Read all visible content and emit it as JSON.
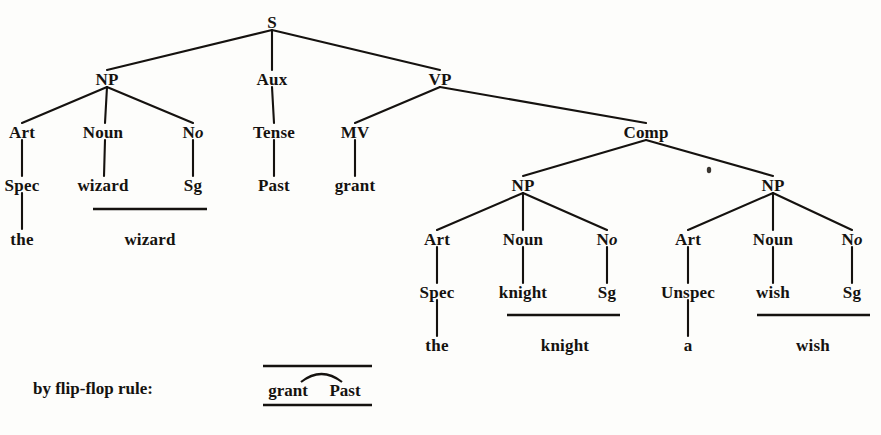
{
  "figure": {
    "type": "syntax-tree-diagram",
    "ink_color": "#15120f",
    "background_color": "#fdfdfb"
  },
  "tree": {
    "root": {
      "label": "S",
      "x": 272,
      "y": 22
    },
    "level1": [
      {
        "label": "NP",
        "x": 107,
        "y": 79
      },
      {
        "label": "Aux",
        "x": 272,
        "y": 79
      },
      {
        "label": "VP",
        "x": 440,
        "y": 79
      }
    ],
    "level2": [
      {
        "label": "Art",
        "x": 22,
        "y": 132
      },
      {
        "label": "Noun",
        "x": 103,
        "y": 132
      },
      {
        "label": "No",
        "x": 193,
        "y": 132,
        "italic_tail": "o",
        "roman_head": "N"
      },
      {
        "label": "Tense",
        "x": 274,
        "y": 132
      },
      {
        "label": "MV",
        "x": 355,
        "y": 132
      },
      {
        "label": "Comp",
        "x": 646,
        "y": 132
      }
    ],
    "level3": [
      {
        "label": "Spec",
        "x": 22,
        "y": 185
      },
      {
        "label": "wizard",
        "x": 103,
        "y": 185
      },
      {
        "label": "Sg",
        "x": 193,
        "y": 185
      },
      {
        "label": "Past",
        "x": 274,
        "y": 185
      },
      {
        "label": "grant",
        "x": 355,
        "y": 185
      },
      {
        "label": "NP",
        "x": 523,
        "y": 185
      },
      {
        "label": "NP",
        "x": 773,
        "y": 185
      }
    ],
    "level4": [
      {
        "label": "Art",
        "x": 437,
        "y": 239
      },
      {
        "label": "Noun",
        "x": 523,
        "y": 239
      },
      {
        "label": "No",
        "x": 607,
        "y": 239,
        "italic_tail": "o",
        "roman_head": "N"
      },
      {
        "label": "Art",
        "x": 688,
        "y": 239
      },
      {
        "label": "Noun",
        "x": 773,
        "y": 239
      },
      {
        "label": "No",
        "x": 852,
        "y": 239,
        "italic_tail": "o",
        "roman_head": "N"
      }
    ],
    "level5": [
      {
        "label": "Spec",
        "x": 437,
        "y": 292
      },
      {
        "label": "knight",
        "x": 523,
        "y": 292
      },
      {
        "label": "Sg",
        "x": 607,
        "y": 292
      },
      {
        "label": "Unspec",
        "x": 688,
        "y": 292
      },
      {
        "label": "wish",
        "x": 773,
        "y": 292
      },
      {
        "label": "Sg",
        "x": 852,
        "y": 292
      }
    ],
    "level6": [
      {
        "label": "the",
        "x": 22,
        "y": 239
      },
      {
        "label": "wizard",
        "x": 150,
        "y": 239
      },
      {
        "label": "the",
        "x": 437,
        "y": 345
      },
      {
        "label": "knight",
        "x": 565,
        "y": 345
      },
      {
        "label": "a",
        "x": 688,
        "y": 345
      },
      {
        "label": "wish",
        "x": 813,
        "y": 345
      }
    ],
    "underlines": [
      {
        "name": "wizard-rule",
        "x1": 93,
        "x2": 207,
        "y": 209
      },
      {
        "name": "knight-rule",
        "x1": 507,
        "x2": 620,
        "y": 315
      },
      {
        "name": "wish-rule",
        "x1": 757,
        "x2": 870,
        "y": 315
      }
    ],
    "branches": [
      {
        "from": [
          272,
          30
        ],
        "to": [
          107,
          70
        ]
      },
      {
        "from": [
          272,
          30
        ],
        "to": [
          272,
          70
        ]
      },
      {
        "from": [
          272,
          30
        ],
        "to": [
          440,
          70
        ]
      },
      {
        "from": [
          107,
          87
        ],
        "to": [
          22,
          123
        ]
      },
      {
        "from": [
          107,
          87
        ],
        "to": [
          105,
          123
        ]
      },
      {
        "from": [
          107,
          87
        ],
        "to": [
          193,
          123
        ]
      },
      {
        "from": [
          272,
          87
        ],
        "to": [
          274,
          123
        ]
      },
      {
        "from": [
          440,
          87
        ],
        "to": [
          355,
          123
        ]
      },
      {
        "from": [
          440,
          87
        ],
        "to": [
          646,
          123
        ]
      },
      {
        "from": [
          22,
          140
        ],
        "to": [
          22,
          176
        ]
      },
      {
        "from": [
          105,
          140
        ],
        "to": [
          104,
          176
        ]
      },
      {
        "from": [
          193,
          140
        ],
        "to": [
          193,
          176
        ]
      },
      {
        "from": [
          274,
          140
        ],
        "to": [
          274,
          176
        ]
      },
      {
        "from": [
          355,
          140
        ],
        "to": [
          355,
          176
        ]
      },
      {
        "from": [
          646,
          140
        ],
        "to": [
          523,
          176
        ]
      },
      {
        "from": [
          646,
          140
        ],
        "to": [
          773,
          176
        ]
      },
      {
        "from": [
          523,
          193
        ],
        "to": [
          437,
          230
        ]
      },
      {
        "from": [
          523,
          193
        ],
        "to": [
          523,
          230
        ]
      },
      {
        "from": [
          523,
          193
        ],
        "to": [
          607,
          230
        ]
      },
      {
        "from": [
          773,
          193
        ],
        "to": [
          688,
          230
        ]
      },
      {
        "from": [
          773,
          193
        ],
        "to": [
          773,
          230
        ]
      },
      {
        "from": [
          773,
          193
        ],
        "to": [
          852,
          230
        ]
      },
      {
        "from": [
          437,
          247
        ],
        "to": [
          437,
          283
        ]
      },
      {
        "from": [
          523,
          247
        ],
        "to": [
          523,
          283
        ]
      },
      {
        "from": [
          607,
          247
        ],
        "to": [
          607,
          283
        ]
      },
      {
        "from": [
          688,
          247
        ],
        "to": [
          688,
          283
        ]
      },
      {
        "from": [
          773,
          247
        ],
        "to": [
          773,
          283
        ]
      },
      {
        "from": [
          852,
          247
        ],
        "to": [
          852,
          283
        ]
      },
      {
        "from": [
          22,
          193
        ],
        "to": [
          22,
          229
        ]
      },
      {
        "from": [
          437,
          300
        ],
        "to": [
          437,
          336
        ]
      },
      {
        "from": [
          688,
          300
        ],
        "to": [
          688,
          336
        ]
      }
    ],
    "speck": {
      "x": 709,
      "y": 170
    }
  },
  "annotation": {
    "caption": "by flip-flop rule:",
    "caption_x": 33,
    "caption_y": 388,
    "top_rule": {
      "x1": 263,
      "x2": 372,
      "y": 366
    },
    "bottom_rule": {
      "x1": 263,
      "x2": 372,
      "y": 405
    },
    "arc": {
      "x1": 301,
      "x2": 342,
      "peak_y": 372,
      "base_y": 382
    },
    "words": [
      {
        "label": "grant",
        "x": 288,
        "y": 390
      },
      {
        "label": "Past",
        "x": 345,
        "y": 390
      }
    ]
  }
}
